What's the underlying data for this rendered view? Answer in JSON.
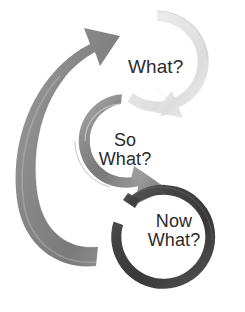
{
  "diagram": {
    "type": "cyclical-process",
    "background_color": "#ffffff",
    "stages": [
      {
        "id": "what",
        "label": "What?",
        "order": 1,
        "ring_color": "#e4e4e4",
        "ring_shade_dark": "#cfcfcf",
        "ring_shade_light": "#f4f4f4",
        "text_color": "#2b2b2b",
        "arrow_direction": "clockwise",
        "arrowhead_position": "lower-left"
      },
      {
        "id": "so-what",
        "label": "So\nWhat?",
        "label_line1": "So",
        "label_line2": "What?",
        "order": 2,
        "ring_color": "#8c8c8c",
        "ring_shade_dark": "#6f6f6f",
        "ring_shade_light": "#a8a8a8",
        "text_color": "#2b2b2b",
        "arrow_direction": "clockwise",
        "arrowhead_position": "lower-right"
      },
      {
        "id": "now-what",
        "label": "Now\nWhat?",
        "label_line1": "Now",
        "label_line2": "What?",
        "order": 3,
        "ring_color": "#474747",
        "ring_shade_dark": "#333333",
        "ring_shade_light": "#5e5e5e",
        "text_color": "#2b2b2b",
        "arrow_direction": "clockwise",
        "arrowhead_position": "upper-left"
      }
    ],
    "return_arrow": {
      "id": "return-to-start",
      "color": "#8c8c8c",
      "shade_dark": "#6f6f6f",
      "shade_light": "#9c9c9c",
      "from_stage": "now-what",
      "to_stage": "what",
      "direction": "counter-clockwise-sweep-up-left"
    }
  }
}
